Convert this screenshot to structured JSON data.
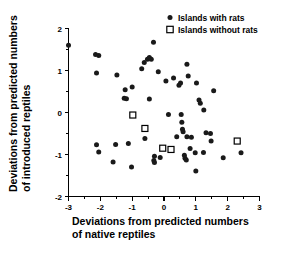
{
  "chart_data": {
    "type": "scatter",
    "title": "",
    "xlabel": "Deviations from predicted numbers of native reptiles",
    "ylabel": "Deviations from predicted numbers of introduced reptiles",
    "xlabel_line1": "Deviations from predicted numbers",
    "xlabel_line2": "of native reptiles",
    "ylabel_line1": "Deviations from predicted numbers",
    "ylabel_line2": "of introduced reptiles",
    "xlim": [
      -3,
      3
    ],
    "ylim": [
      -2,
      2
    ],
    "xticks": [
      -3,
      -2,
      -1,
      0,
      1,
      2,
      3
    ],
    "xticklabels": [
      "-3",
      "-2",
      "-1",
      "0",
      "1",
      "2",
      "3"
    ],
    "yticks": [
      -2,
      -1,
      0,
      1,
      2
    ],
    "yticklabels": [
      "-2",
      "-1",
      "0",
      "1",
      "2"
    ],
    "x_minor_tick_step": 0.5,
    "y_minor_tick_step": 0.5,
    "grid": false,
    "legend_position": "top-right",
    "series": [
      {
        "name": "Islands with rats",
        "marker": "filled-circle",
        "color": "#1a1a1a",
        "points": [
          [
            -3.0,
            1.6
          ],
          [
            -2.15,
            1.38
          ],
          [
            -2.05,
            1.36
          ],
          [
            -2.12,
            0.94
          ],
          [
            -1.48,
            0.89
          ],
          [
            -1.22,
            0.54
          ],
          [
            -1.0,
            0.61
          ],
          [
            -1.25,
            0.34
          ],
          [
            -1.18,
            0.33
          ],
          [
            -0.62,
            1.19
          ],
          [
            -0.52,
            1.27
          ],
          [
            -0.46,
            1.31
          ],
          [
            -0.4,
            1.27
          ],
          [
            -0.33,
            1.67
          ],
          [
            -0.7,
            1.04
          ],
          [
            -0.46,
            0.32
          ],
          [
            -0.18,
            0.97
          ],
          [
            0.06,
            0.75
          ],
          [
            0.3,
            0.82
          ],
          [
            0.52,
            0.7
          ],
          [
            0.47,
            0.65
          ],
          [
            0.72,
            1.15
          ],
          [
            0.76,
            0.87
          ],
          [
            1.02,
            0.7
          ],
          [
            1.1,
            0.3
          ],
          [
            1.14,
            0.22
          ],
          [
            1.25,
            0.06
          ],
          [
            1.56,
            0.52
          ],
          [
            0.14,
            -0.05
          ],
          [
            0.54,
            -0.05
          ],
          [
            0.56,
            -0.23
          ],
          [
            0.58,
            -0.4
          ],
          [
            0.6,
            -0.46
          ],
          [
            0.4,
            -0.58
          ],
          [
            0.72,
            -0.58
          ],
          [
            0.86,
            -0.59
          ],
          [
            1.32,
            -0.48
          ],
          [
            1.48,
            -0.68
          ],
          [
            -0.6,
            -0.62
          ],
          [
            -2.12,
            -0.77
          ],
          [
            -2.05,
            -0.94
          ],
          [
            -1.52,
            -0.76
          ],
          [
            -1.6,
            -1.18
          ],
          [
            -1.12,
            -0.74
          ],
          [
            -1.02,
            -1.3
          ],
          [
            -0.3,
            -1.04
          ],
          [
            -0.32,
            -1.14
          ],
          [
            -0.3,
            -1.19
          ],
          [
            -0.12,
            -1.07
          ],
          [
            0.64,
            -1.02
          ],
          [
            0.66,
            -1.09
          ],
          [
            0.7,
            -1.13
          ],
          [
            0.98,
            -0.96
          ],
          [
            1.24,
            -0.95
          ],
          [
            1.0,
            -1.39
          ],
          [
            1.86,
            -1.08
          ],
          [
            2.42,
            -0.96
          ],
          [
            0.82,
            -0.86
          ],
          [
            1.46,
            -0.5
          ]
        ]
      },
      {
        "name": "Islands without rats",
        "marker": "open-square",
        "color": "#ffffff",
        "points": [
          [
            -0.98,
            -0.06
          ],
          [
            -0.6,
            -0.38
          ],
          [
            -0.04,
            -0.85
          ],
          [
            0.22,
            -0.88
          ],
          [
            2.3,
            -0.68
          ]
        ]
      }
    ],
    "legend": [
      {
        "label": "Islands with rats",
        "marker": "filled-circle"
      },
      {
        "label": "Islands without rats",
        "marker": "open-square"
      }
    ]
  }
}
